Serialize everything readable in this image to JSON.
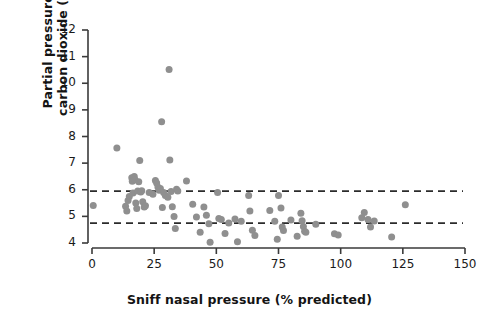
{
  "figure": {
    "background_color": "#ffffff",
    "point_color": "#8f8f8f",
    "axis_color": "#3a3a3a",
    "dash_color": "#2b2b2b",
    "text_color": "#141414"
  },
  "axis_labels": {
    "y_line1": "Partial pressure of",
    "y_line2": "carbon dioxide (kPa)",
    "x": "Sniff nasal pressure (% predicted)"
  },
  "chart_data": {
    "type": "scatter",
    "title": "",
    "xlabel": "Sniff nasal pressure (% predicted)",
    "ylabel": "Partial pressure of carbon dioxide (kPa)",
    "xlim": [
      0,
      150
    ],
    "ylim": [
      4,
      12
    ],
    "xticks": [
      0,
      25,
      50,
      75,
      100,
      125,
      150
    ],
    "yticks": [
      4,
      5,
      6,
      7,
      8,
      9,
      10,
      11,
      12
    ],
    "xtick_labels": [
      "0",
      "25",
      "50",
      "75",
      "100",
      "125",
      "150"
    ],
    "ytick_labels": [
      "4",
      "5",
      "6",
      "7",
      "8",
      "9",
      "10",
      "11",
      "12"
    ],
    "grid": false,
    "legend": null,
    "marker": "circle",
    "marker_size": 7,
    "reference_lines": [
      {
        "name": "upper-reference-line",
        "axis": "y",
        "value": 5.95,
        "style": "dashed"
      },
      {
        "name": "lower-reference-line",
        "axis": "y",
        "value": 4.75,
        "style": "dashed"
      }
    ],
    "points": [
      [
        0.5,
        5.41
      ],
      [
        10.0,
        7.57
      ],
      [
        13.5,
        5.38
      ],
      [
        14.0,
        5.2
      ],
      [
        14.5,
        5.6
      ],
      [
        15.0,
        5.75
      ],
      [
        16.0,
        6.45
      ],
      [
        16.2,
        6.32
      ],
      [
        16.5,
        5.88
      ],
      [
        17.0,
        6.5
      ],
      [
        17.3,
        6.38
      ],
      [
        17.6,
        5.5
      ],
      [
        18.0,
        5.3
      ],
      [
        18.4,
        5.95
      ],
      [
        18.8,
        6.3
      ],
      [
        19.2,
        7.1
      ],
      [
        19.6,
        5.92
      ],
      [
        20.0,
        5.96
      ],
      [
        20.4,
        5.55
      ],
      [
        21.0,
        5.35
      ],
      [
        21.5,
        5.4
      ],
      [
        23.0,
        5.9
      ],
      [
        24.5,
        5.83
      ],
      [
        25.5,
        6.35
      ],
      [
        26.0,
        6.25
      ],
      [
        26.5,
        6.1
      ],
      [
        27.0,
        5.98
      ],
      [
        27.5,
        6.05
      ],
      [
        28.0,
        8.55
      ],
      [
        28.3,
        5.33
      ],
      [
        28.8,
        5.9
      ],
      [
        29.5,
        5.78
      ],
      [
        30.5,
        5.72
      ],
      [
        31.0,
        10.52
      ],
      [
        31.3,
        7.12
      ],
      [
        31.8,
        5.93
      ],
      [
        32.3,
        5.36
      ],
      [
        33.0,
        5.0
      ],
      [
        33.5,
        4.54
      ],
      [
        34.0,
        6.02
      ],
      [
        34.5,
        5.95
      ],
      [
        38.0,
        6.33
      ],
      [
        40.5,
        5.46
      ],
      [
        42.0,
        4.98
      ],
      [
        43.5,
        4.4
      ],
      [
        45.0,
        5.35
      ],
      [
        46.0,
        5.04
      ],
      [
        47.0,
        4.72
      ],
      [
        47.5,
        4.03
      ],
      [
        50.5,
        5.9
      ],
      [
        51.0,
        4.92
      ],
      [
        52.0,
        4.88
      ],
      [
        53.5,
        4.36
      ],
      [
        55.0,
        4.75
      ],
      [
        57.5,
        4.9
      ],
      [
        58.5,
        4.05
      ],
      [
        60.0,
        4.82
      ],
      [
        63.0,
        5.78
      ],
      [
        63.5,
        5.2
      ],
      [
        64.5,
        4.48
      ],
      [
        65.5,
        4.28
      ],
      [
        71.5,
        5.22
      ],
      [
        73.5,
        4.82
      ],
      [
        74.5,
        4.14
      ],
      [
        75.0,
        5.78
      ],
      [
        76.0,
        5.31
      ],
      [
        76.5,
        4.6
      ],
      [
        77.0,
        4.47
      ],
      [
        80.0,
        4.86
      ],
      [
        82.5,
        4.25
      ],
      [
        84.0,
        5.12
      ],
      [
        84.5,
        4.84
      ],
      [
        85.0,
        4.62
      ],
      [
        85.5,
        4.44
      ],
      [
        86.0,
        4.4
      ],
      [
        90.0,
        4.7
      ],
      [
        97.5,
        4.35
      ],
      [
        99.0,
        4.3
      ],
      [
        108.5,
        4.95
      ],
      [
        109.5,
        5.15
      ],
      [
        111.0,
        4.88
      ],
      [
        112.0,
        4.6
      ],
      [
        113.5,
        4.83
      ],
      [
        120.5,
        4.23
      ],
      [
        126.0,
        5.44
      ]
    ]
  }
}
